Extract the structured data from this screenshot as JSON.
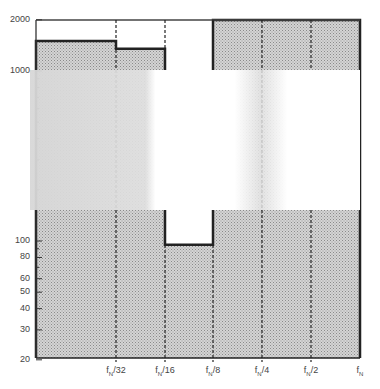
{
  "chart_data": {
    "type": "bar",
    "title": "",
    "xlabel": "",
    "ylabel": "",
    "yscale": "log",
    "ylim": [
      20,
      2000
    ],
    "grid": false,
    "legend": null,
    "y_ticks": [
      20,
      30,
      40,
      50,
      60,
      80,
      100,
      1000,
      2000
    ],
    "y_tick_labels": [
      "20",
      "30",
      "40",
      "50",
      "60",
      "80",
      "100",
      "1000",
      "2000"
    ],
    "x_tick_labels": [
      "fN/32",
      "fN/16",
      "fN/8",
      "fN/4",
      "fN/2",
      "fN"
    ],
    "categories": [
      "0–fN/32",
      "fN/32–fN/16",
      "fN/16–fN/8",
      "fN/8–fN/4",
      "fN/4–fN/2",
      "fN/2–fN"
    ],
    "values": [
      1500,
      1350,
      95,
      2000,
      2000,
      2000
    ],
    "annotations": [
      "shaded (stippled) fill under step curve",
      "dashed vertical lines at octave boundaries"
    ]
  },
  "labels": {
    "y": [
      "2000",
      "1000",
      "100",
      "80",
      "60",
      "50",
      "40",
      "30",
      "20"
    ],
    "x_main": [
      "f",
      "f",
      "f",
      "f",
      "f",
      "f"
    ],
    "x_sub": [
      "N",
      "N",
      "N",
      "N",
      "N",
      "N"
    ],
    "x_suffix": [
      "/32",
      "/16",
      "/8",
      "/4",
      "/2",
      ""
    ]
  }
}
